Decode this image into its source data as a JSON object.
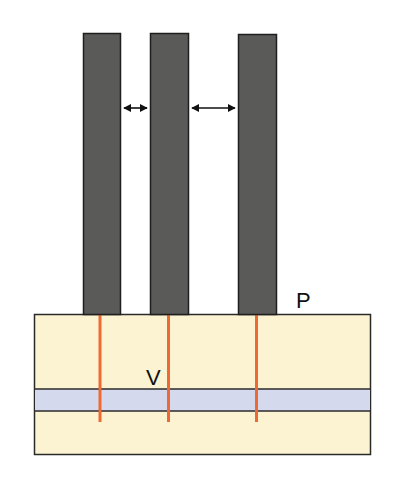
{
  "diagram": {
    "colors": {
      "column_fill": "#5a5a58",
      "column_stroke": "#1e1e1e",
      "ground_fill": "#fcf3d2",
      "band_fill": "#d5d9ee",
      "outline": "#2a2a2a",
      "pile_line": "#ef6a33",
      "arrow": "#111111"
    },
    "labels": {
      "p": "P",
      "v": "V"
    },
    "columns": [
      {
        "name": "column-1",
        "x": 83,
        "width": 38
      },
      {
        "name": "column-2",
        "x": 150,
        "width": 39
      },
      {
        "name": "column-3",
        "x": 238,
        "width": 39
      }
    ],
    "spacing_arrows": [
      {
        "name": "spacing-arrow-1",
        "x1": 122,
        "x2": 149,
        "y": 108
      },
      {
        "name": "spacing-arrow-2",
        "x1": 190,
        "x2": 237,
        "y": 108
      }
    ]
  }
}
